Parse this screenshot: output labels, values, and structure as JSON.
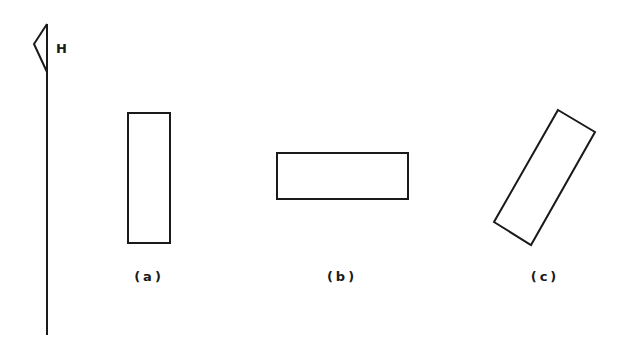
{
  "figure": {
    "reference": {
      "label": "H",
      "line": {
        "x": 47,
        "y1": 24,
        "y2": 335
      },
      "flag": {
        "points": "47,24 34,44 47,72"
      }
    },
    "shapes": [
      {
        "id": "a",
        "label": "(a)",
        "kind": "rectangle",
        "orientation": "vertical",
        "points": "128,113 170,113 170,243 128,243",
        "label_pos": {
          "x": 149,
          "y": 281
        }
      },
      {
        "id": "b",
        "label": "(b)",
        "kind": "rectangle",
        "orientation": "horizontal",
        "points": "277,153 408,153 408,199 277,199",
        "label_pos": {
          "x": 342,
          "y": 281
        }
      },
      {
        "id": "c",
        "label": "(c)",
        "kind": "rectangle",
        "orientation": "tilted",
        "points": "558,110 595,132 531,245 494,222",
        "label_pos": {
          "x": 545,
          "y": 281
        }
      }
    ],
    "stroke_color": "#1a1a1a",
    "background": "#ffffff"
  }
}
